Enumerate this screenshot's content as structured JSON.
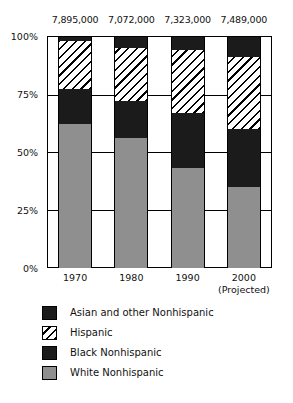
{
  "chart_data": {
    "type": "bar",
    "subtype": "stacked-100-percent",
    "title": "",
    "subtitle": "",
    "xlabel": "",
    "ylabel": "",
    "categories": [
      "1970",
      "1980",
      "1990",
      "2000"
    ],
    "category_sublabels": [
      "",
      "",
      "",
      "(Projected)"
    ],
    "ylim": [
      0,
      100
    ],
    "ytick_labels": [
      "0%",
      "25%",
      "50%",
      "75%",
      "100%"
    ],
    "ytick_values": [
      0,
      25,
      50,
      75,
      100
    ],
    "grid": true,
    "legend_position": "bottom-left",
    "column_totals": [
      "7,895,000",
      "7,072,000",
      "7,323,000",
      "7,489,000"
    ],
    "column_total_values": [
      7895000,
      7072000,
      7323000,
      7489000
    ],
    "stack_order_bottom_to_top": [
      "White Nonhispanic",
      "Black Nonhispanic",
      "Hispanic",
      "Asian and other Nonhispanic"
    ],
    "series": [
      {
        "name": "White Nonhispanic",
        "pattern": "solid-gray",
        "color": "#8f8f8f",
        "values": [
          62,
          56,
          43,
          35
        ]
      },
      {
        "name": "Black Nonhispanic",
        "pattern": "solid-black",
        "color": "#1b1b1b",
        "values": [
          15,
          16,
          24,
          25
        ]
      },
      {
        "name": "Hispanic",
        "pattern": "diagonal-hatch",
        "color": "#ffffff",
        "values": [
          21,
          23,
          27,
          31
        ]
      },
      {
        "name": "Asian and other Nonhispanic",
        "pattern": "solid-black",
        "color": "#1b1b1b",
        "values": [
          2,
          5,
          6,
          9
        ]
      }
    ]
  },
  "totals": {
    "t0": "7,895,000",
    "t1": "7,072,000",
    "t2": "7,323,000",
    "t3": "7,489,000"
  },
  "yaxis": {
    "tick0": "0%",
    "tick1": "25%",
    "tick2": "50%",
    "tick3": "75%",
    "tick4": "100%"
  },
  "xaxis": {
    "tick0": "1970",
    "tick1": "1980",
    "tick2": "1990",
    "tick3": "2000",
    "tick3_sub": "(Projected)"
  },
  "legend": {
    "items": [
      {
        "label": "Asian and other Nonhispanic",
        "swatch": "solid-black-swatch-icon"
      },
      {
        "label": "Hispanic",
        "swatch": "diagonal-hatch-swatch-icon"
      },
      {
        "label": "Black Nonhispanic",
        "swatch": "solid-black-swatch-icon"
      },
      {
        "label": "White Nonhispanic",
        "swatch": "solid-gray-swatch-icon"
      }
    ]
  },
  "colors": {
    "black": "#1b1b1b",
    "gray": "#8f8f8f",
    "white": "#ffffff",
    "axis": "#000000"
  }
}
